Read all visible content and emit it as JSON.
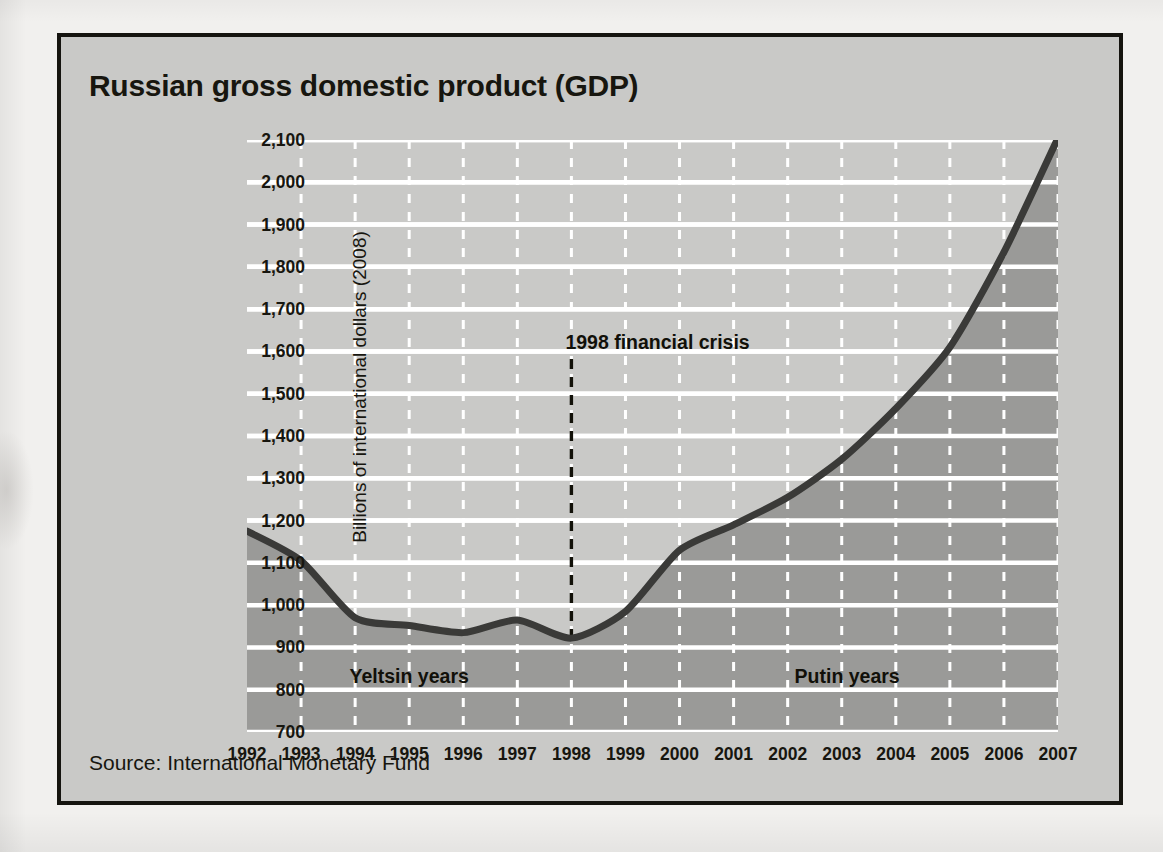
{
  "figure": {
    "title": "Russian gross domestic product (GDP)",
    "source": "Source: International Monetary Fund"
  },
  "annotations": {
    "crisis": "1998 financial crisis",
    "yeltsin": "Yeltsin years",
    "putin": "Putin years"
  },
  "colors": {
    "panel_background": "#c9c9c7",
    "area_fill": "#9a9a98",
    "line": "#3a3a38",
    "gridline": "#ffffff",
    "frame": "#15140f",
    "text": "#17160f"
  },
  "chart_data": {
    "type": "area",
    "title": "Russian gross domestic product (GDP)",
    "subtitle": "",
    "xlabel": "",
    "ylabel": "Billions of international dollars (2008)",
    "source": "Source: International Monetary Fund",
    "grid": true,
    "legend": "none",
    "xlim": [
      1992,
      2007
    ],
    "ylim": [
      700,
      2100
    ],
    "ytick_step": 100,
    "x": [
      1992,
      1993,
      1994,
      1995,
      1996,
      1997,
      1998,
      1999,
      2000,
      2001,
      2002,
      2003,
      2004,
      2005,
      2006,
      2007
    ],
    "xticklabels": [
      "1992",
      "1993",
      "1994",
      "1995",
      "1996",
      "1997",
      "1998",
      "1999",
      "2000",
      "2001",
      "2002",
      "2003",
      "2004",
      "2005",
      "2006",
      "2007"
    ],
    "yticklabels": [
      "700",
      "800",
      "900",
      "1,000",
      "1,100",
      "1,200",
      "1,300",
      "1,400",
      "1,500",
      "1,600",
      "1,700",
      "1,800",
      "1,900",
      "2,000",
      "2,100"
    ],
    "series": [
      {
        "name": "Russian GDP",
        "values": [
          1175,
          1105,
          970,
          952,
          935,
          965,
          922,
          985,
          1130,
          1190,
          1255,
          1345,
          1465,
          1610,
          1835,
          2105
        ]
      }
    ],
    "annotations": [
      {
        "text": "1998 financial crisis",
        "x": 1998,
        "y": 1620,
        "marker": "vertical-dashed-line"
      },
      {
        "text": "Yeltsin years",
        "x": 1995,
        "y": 830
      },
      {
        "text": "Putin years",
        "x": 2003.1,
        "y": 830
      }
    ]
  }
}
